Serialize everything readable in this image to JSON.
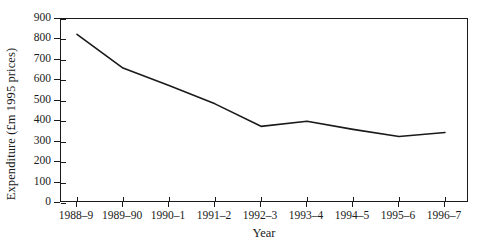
{
  "chart_data": {
    "type": "line",
    "title": "",
    "xlabel": "Year",
    "ylabel": "Expenditure (£m 1995 prices)",
    "categories": [
      "1988–9",
      "1989–90",
      "1990–1",
      "1991–2",
      "1992–3",
      "1993–4",
      "1994–5",
      "1995–6",
      "1996–7"
    ],
    "values": [
      825,
      660,
      575,
      485,
      375,
      400,
      360,
      325,
      345
    ],
    "series": [
      {
        "name": "Expenditure",
        "values": [
          825,
          660,
          575,
          485,
          375,
          400,
          360,
          325,
          345
        ],
        "color": "#1a1a1a"
      }
    ],
    "ylim": [
      0,
      900
    ],
    "yticks": [
      0,
      100,
      200,
      300,
      400,
      500,
      600,
      700,
      800,
      900
    ],
    "ytick_labels": [
      "0",
      "100",
      "200",
      "300",
      "400",
      "500",
      "600",
      "700",
      "800",
      "900"
    ],
    "grid": false,
    "legend": false,
    "legend_position": "none",
    "line_color": "#1a1a1a",
    "line_width": 1.6,
    "markers": false,
    "frame": true,
    "background": "#ffffff"
  }
}
